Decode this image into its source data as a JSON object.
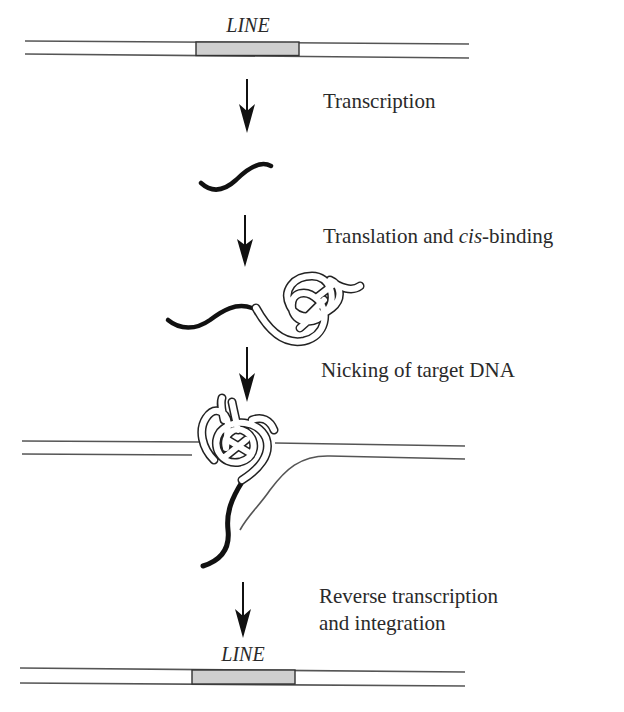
{
  "figure": {
    "colors": {
      "background": "#ffffff",
      "dna_strand": "#555555",
      "rna_strand": "#111111",
      "element_fill": "#cfcfcf",
      "element_outline": "#333333",
      "protein_outline": "#222222",
      "arrow": "#111111",
      "text": "#2a2a2a"
    },
    "top_dna": {
      "element_label": "LINE"
    },
    "bottom_dna": {
      "element_label": "LINE"
    },
    "steps": [
      {
        "id": "transcription",
        "label": "Transcription"
      },
      {
        "id": "translation",
        "label_prefix": "Translation and ",
        "label_italic": "cis",
        "label_suffix": "-binding"
      },
      {
        "id": "nicking",
        "label": "Nicking of target DNA"
      },
      {
        "id": "reverse-transcription",
        "label_line1": "Reverse transcription",
        "label_line2": "and integration"
      }
    ]
  }
}
